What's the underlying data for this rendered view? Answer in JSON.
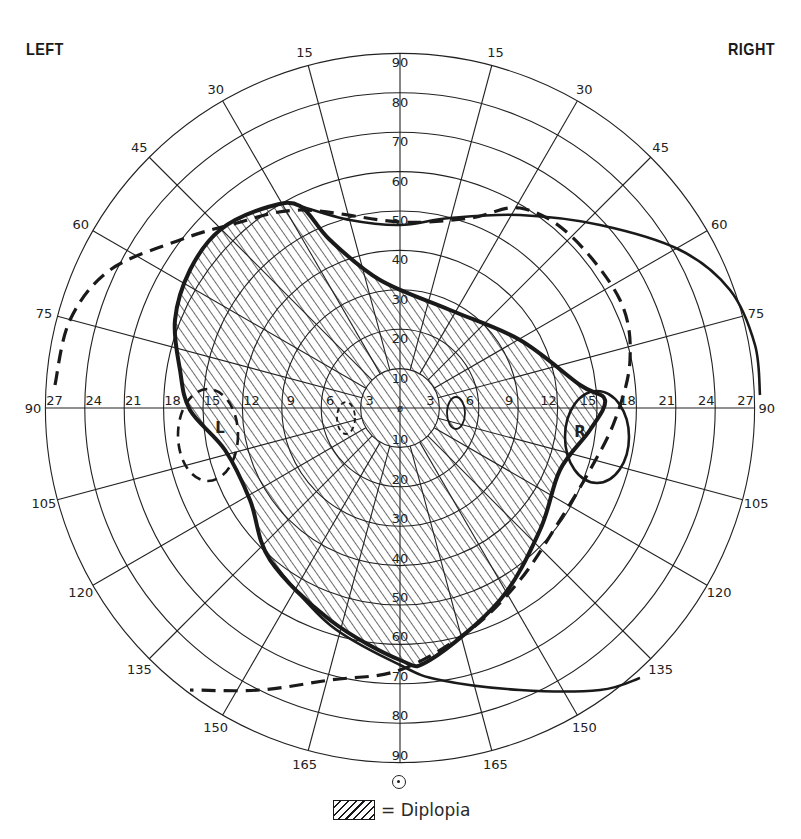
{
  "header": {
    "left_label": "LEFT",
    "right_label": "RIGHT"
  },
  "legend": {
    "swatch": "diagonal-hatch",
    "text": "= Diplopia"
  },
  "fixation_marker": "target-circle-dot",
  "grid": {
    "center": [
      400,
      408
    ],
    "ring_step_px": 39.4,
    "ring_count": 9,
    "spoke_step_deg": 15,
    "vertical_ring_labels_top": [
      "10",
      "20",
      "30",
      "40",
      "50",
      "60",
      "70",
      "80",
      "90"
    ],
    "vertical_ring_labels_bottom": [
      "10",
      "20",
      "30",
      "40",
      "50",
      "60",
      "70",
      "80",
      "90"
    ],
    "horizontal_ring_labels": [
      "3",
      "6",
      "9",
      "12",
      "15",
      "18",
      "21",
      "24",
      "27"
    ],
    "horizontal_end_label": "90",
    "meridian_labels_left": [
      "15",
      "30",
      "45",
      "60",
      "75",
      "105",
      "120",
      "135",
      "150",
      "165"
    ],
    "meridian_labels_right": [
      "15",
      "30",
      "45",
      "60",
      "75",
      "105",
      "120",
      "135",
      "150",
      "165"
    ],
    "center_glyph": "ø"
  },
  "blind_spot_labels": {
    "left": "L",
    "right": "R"
  },
  "colors": {
    "ink": "#1a1a1a",
    "background": "#ffffff",
    "grid": "#222222"
  },
  "chart_data": {
    "type": "polar-field-diagram",
    "subtitle": "",
    "axes": {
      "radial_scale_vertical": [
        0,
        10,
        20,
        30,
        40,
        50,
        60,
        70,
        80,
        90
      ],
      "radial_scale_horizontal": [
        0,
        3,
        6,
        9,
        12,
        15,
        18,
        21,
        24,
        27
      ],
      "meridians_deg": [
        0,
        15,
        30,
        45,
        60,
        75,
        90,
        105,
        120,
        135,
        150,
        165,
        180
      ]
    },
    "series": [
      {
        "name": "Diplopia region",
        "style": "hatched fill, thick solid outline",
        "approx_outline_px": [
          [
            268,
            207
          ],
          [
            300,
            206
          ],
          [
            330,
            240
          ],
          [
            380,
            280
          ],
          [
            450,
            310
          ],
          [
            520,
            340
          ],
          [
            580,
            385
          ],
          [
            605,
            400
          ],
          [
            590,
            430
          ],
          [
            560,
            470
          ],
          [
            540,
            530
          ],
          [
            500,
            600
          ],
          [
            430,
            660
          ],
          [
            400,
            660
          ],
          [
            330,
            620
          ],
          [
            270,
            560
          ],
          [
            250,
            500
          ],
          [
            225,
            450
          ],
          [
            190,
            410
          ],
          [
            180,
            370
          ],
          [
            175,
            320
          ],
          [
            190,
            270
          ],
          [
            220,
            230
          ]
        ]
      },
      {
        "name": "Left eye field",
        "style": "dashed outline",
        "approx_outline_px": [
          [
            55,
            385
          ],
          [
            70,
            320
          ],
          [
            110,
            270
          ],
          [
            180,
            240
          ],
          [
            230,
            225
          ],
          [
            300,
            210
          ],
          [
            400,
            222
          ],
          [
            470,
            218
          ],
          [
            520,
            208
          ],
          [
            570,
            235
          ],
          [
            620,
            300
          ],
          [
            630,
            360
          ],
          [
            615,
            420
          ],
          [
            590,
            470
          ],
          [
            560,
            520
          ],
          [
            520,
            580
          ],
          [
            470,
            630
          ],
          [
            400,
            670
          ],
          [
            330,
            680
          ],
          [
            260,
            690
          ],
          [
            190,
            690
          ]
        ]
      },
      {
        "name": "Right eye field",
        "style": "solid thin outline",
        "approx_outline_px": [
          [
            300,
            206
          ],
          [
            350,
            220
          ],
          [
            400,
            225
          ],
          [
            450,
            218
          ],
          [
            520,
            215
          ],
          [
            600,
            225
          ],
          [
            680,
            250
          ],
          [
            730,
            290
          ],
          [
            755,
            345
          ],
          [
            760,
            395
          ]
        ]
      },
      {
        "name": "Right eye lower boundary",
        "style": "solid thin outline",
        "approx_outline_px": [
          [
            270,
            560
          ],
          [
            330,
            625
          ],
          [
            400,
            665
          ],
          [
            440,
            680
          ],
          [
            520,
            690
          ],
          [
            600,
            690
          ],
          [
            640,
            678
          ]
        ]
      }
    ],
    "annotations": [
      "LEFT",
      "RIGHT",
      "L (blind spot)",
      "R (blind spot)",
      "= Diplopia"
    ],
    "grid": true,
    "legend_position": "bottom-center"
  }
}
